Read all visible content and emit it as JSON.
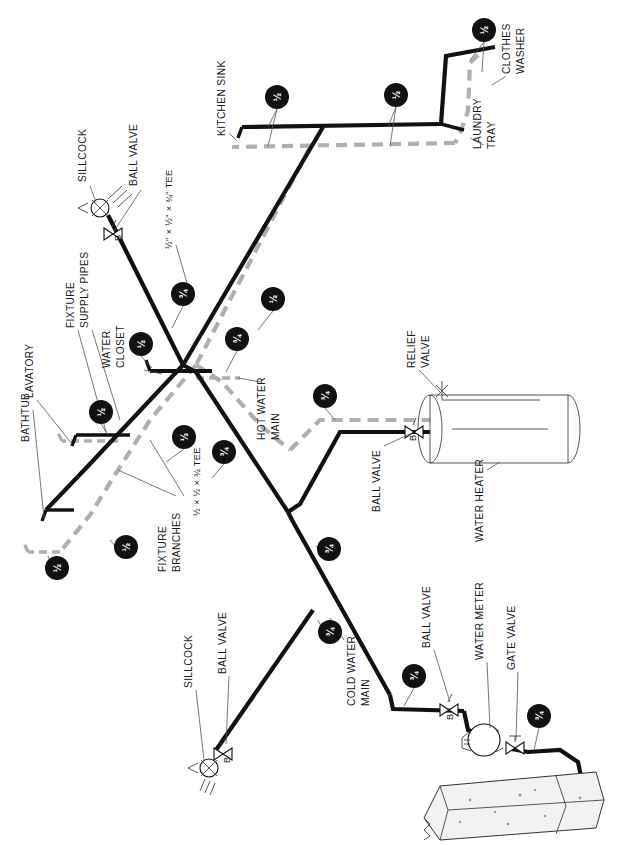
{
  "diagram": {
    "orientation": "rotated-90",
    "colors": {
      "cold_water_line": "#111111",
      "hot_water_line": "#b0b0b0",
      "tag_fill": "#111111",
      "tag_text": "#ffffff",
      "leader_line": "#555555",
      "background": "#ffffff"
    }
  },
  "labels": {
    "sillcock_top": "SILLCOCK",
    "ball_valve_top": "BALL VALVE",
    "tee_half_half_three_quarter": "½\" × ½\" × ¾\" TEE",
    "kitchen_sink": "KITCHEN SINK",
    "clothes_washer_line1": "CLOTHES",
    "clothes_washer_line2": "WASHER",
    "laundry_tray_line1": "LAUNDRY",
    "laundry_tray_line2": "TRAY",
    "fixture_supply_pipes_line1": "FIXTURE",
    "fixture_supply_pipes_line2": "SUPPLY PIPES",
    "lavatory": "LAVATORY",
    "bathtub": "BATHTUB",
    "water_closet_line1": "WATER",
    "water_closet_line2": "CLOSET",
    "fixture_branches_line1": "FIXTURE",
    "fixture_branches_line2": "BRANCHES",
    "tee_half_half_three_quarter_2": "½ × ½ × ¾ TEE",
    "hot_water_main_line1": "HOT WATER",
    "hot_water_main_line2": "MAIN",
    "relief_valve_line1": "RELIEF",
    "relief_valve_line2": "VALVE",
    "ball_valve_heater": "BALL VALVE",
    "water_heater": "WATER HEATER",
    "sillcock_bottom": "SILLCOCK",
    "ball_valve_bottom": "BALL VALVE",
    "cold_water_main_line1": "COLD WATER",
    "cold_water_main_line2": "MAIN",
    "ball_valve_meter": "BALL VALVE",
    "water_meter": "WATER METER",
    "gate_valve": "GATE VALVE",
    "valve_letter_b": "B"
  },
  "size_tags": [
    {
      "id": "tag-clothes-washer",
      "size": "½",
      "x": 484,
      "y": 30
    },
    {
      "id": "tag-kitchen-sink",
      "size": "½",
      "x": 277,
      "y": 97
    },
    {
      "id": "tag-laundry-tray",
      "size": "½",
      "x": 396,
      "y": 95
    },
    {
      "id": "tag-riser-main",
      "size": "¾",
      "x": 183,
      "y": 294
    },
    {
      "id": "tag-hot-branch",
      "size": "½",
      "x": 273,
      "y": 299
    },
    {
      "id": "tag-water-closet",
      "size": "½",
      "x": 141,
      "y": 344
    },
    {
      "id": "tag-hot-main-top",
      "size": "¾",
      "x": 237,
      "y": 339
    },
    {
      "id": "tag-heater-hot",
      "size": "¾",
      "x": 325,
      "y": 396
    },
    {
      "id": "tag-lavatory",
      "size": "½",
      "x": 101,
      "y": 412
    },
    {
      "id": "tag-fixture-branch",
      "size": "½",
      "x": 184,
      "y": 437
    },
    {
      "id": "tag-tee-branch",
      "size": "¾",
      "x": 224,
      "y": 452
    },
    {
      "id": "tag-bathtub",
      "size": "½",
      "x": 126,
      "y": 547
    },
    {
      "id": "tag-bathtub-low",
      "size": "½",
      "x": 57,
      "y": 568
    },
    {
      "id": "tag-cold-riser",
      "size": "¾",
      "x": 329,
      "y": 549
    },
    {
      "id": "tag-cold-main-mid",
      "size": "¾",
      "x": 330,
      "y": 632
    },
    {
      "id": "tag-meter-branch",
      "size": "¾",
      "x": 414,
      "y": 676
    },
    {
      "id": "tag-service-entry",
      "size": "¾",
      "x": 539,
      "y": 716
    }
  ]
}
